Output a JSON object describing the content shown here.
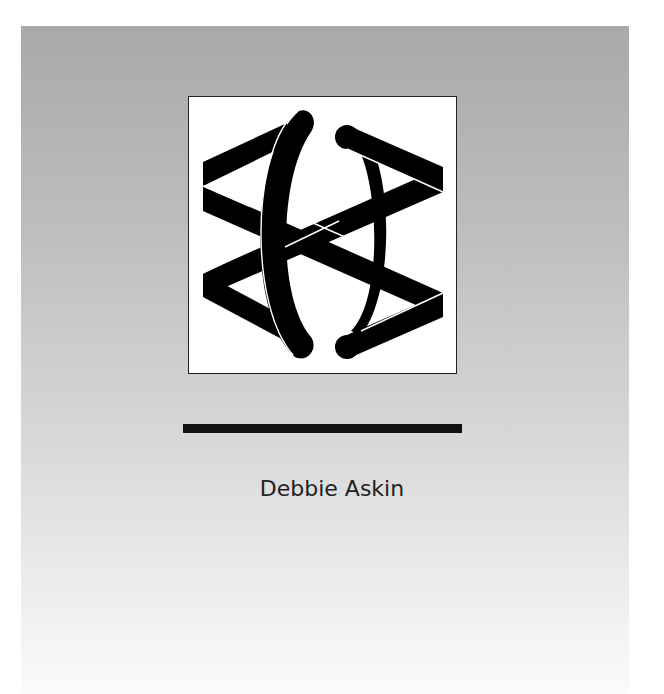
{
  "cover": {
    "logo": {
      "icon": "interlaced-ribbon-hexagram-logo",
      "stroke_color": "#000000",
      "background": "#ffffff"
    },
    "rule_color": "#111111",
    "author_name": "Debbie Askin",
    "background_gradient": [
      "#a9a9a9",
      "#fbfbfb"
    ]
  }
}
